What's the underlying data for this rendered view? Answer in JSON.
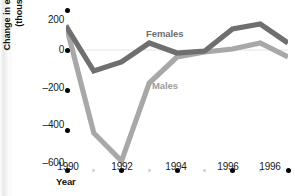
{
  "chart_data": {
    "type": "line",
    "title": "",
    "xlabel": "Year",
    "ylabel": "Change in employment (thousands)",
    "ylabel_line1": "Change in employment",
    "ylabel_line2": "(thousands)",
    "grid": false,
    "legend_position": "inline-annotations",
    "ylim": [
      -600,
      200
    ],
    "yticks": [
      200,
      0,
      -200,
      -400,
      -600
    ],
    "ytick_labels": [
      "200",
      "0",
      "–200",
      "–400",
      "–600"
    ],
    "xlim": [
      1990,
      1998
    ],
    "x": [
      1990,
      1991,
      1992,
      1993,
      1994,
      1995,
      1996,
      1997,
      1998
    ],
    "xticks": [
      1990,
      1992,
      1994,
      1996,
      1998
    ],
    "xtick_labels": [
      "1990",
      "1992",
      "1994",
      "1996",
      "1996"
    ],
    "xminor_ticks": [
      1991,
      1993,
      1995,
      1997
    ],
    "series": [
      {
        "name": "Females",
        "color": "#6f6f6f",
        "label_text": "Females",
        "values": [
          120,
          -105,
          -60,
          35,
          -15,
          -5,
          105,
          130,
          35
        ]
      },
      {
        "name": "Males",
        "color": "#a8a8a8",
        "label_text": "Males",
        "values": [
          125,
          -415,
          -555,
          -165,
          -35,
          -10,
          5,
          35,
          -35
        ]
      }
    ],
    "zero_line": 0
  },
  "axis": {
    "y_title_line1": "Change in employment",
    "y_title_line2": "(thousands)",
    "x_title": "Year"
  },
  "colors": {
    "females": "#6f6f6f",
    "males": "#a8a8a8",
    "tick_dot": "#000000",
    "minor_tick_dot": "#cfcfcf",
    "text": "#1a1a1a",
    "background": "#ffffff"
  }
}
